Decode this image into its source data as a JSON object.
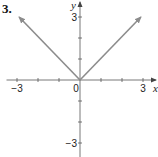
{
  "problem_number": "3.",
  "chart_data": {
    "type": "line",
    "title": "",
    "xlabel": "x",
    "ylabel": "y",
    "xlim": [
      -3.5,
      3.5
    ],
    "ylim": [
      -3.5,
      3.5
    ],
    "x_ticks": [
      -3,
      -2,
      -1,
      1,
      2,
      3
    ],
    "y_ticks": [
      -3,
      -2,
      -1,
      1,
      2,
      3
    ],
    "x_tick_labels": [
      "-3",
      "0",
      "3"
    ],
    "y_tick_labels": [
      "3",
      "-3"
    ],
    "origin_label": "0",
    "grid": false,
    "series": [
      {
        "name": "y = |x|",
        "color": "#8c8c8c",
        "x": [
          -3,
          0,
          3
        ],
        "y": [
          3,
          0,
          3
        ],
        "arrows": "both-ends"
      }
    ]
  },
  "labels": {
    "x_neg3": "−3",
    "x_3": "3",
    "origin": "0",
    "y_3": "3",
    "y_neg3": "−3",
    "x_axis": "x",
    "y_axis": "y"
  }
}
